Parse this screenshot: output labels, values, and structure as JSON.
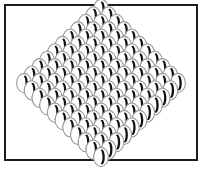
{
  "figure": {
    "canvas": {
      "width": 207,
      "height": 173,
      "background": "#ffffff"
    },
    "frame": {
      "name": "outer-border",
      "x": 5,
      "y": 5,
      "width": 192,
      "height": 155,
      "stroke": "#1c1c1c",
      "stroke_width": 2,
      "fill": "none"
    },
    "lattice": {
      "type": "rhombus",
      "arrangement": "staggered-hexagonal",
      "row_counts": [
        1,
        2,
        3,
        4,
        5,
        6,
        7,
        8,
        9,
        10,
        11,
        10,
        9,
        8,
        7,
        6,
        5,
        4,
        3,
        2,
        1
      ],
      "rows_rendered": 21,
      "total_cells": 121,
      "center_x": 101,
      "center_y": 83,
      "col_spacing": 15.4,
      "row_spacing": 7.4,
      "row_offset_alternating": true
    },
    "cell": {
      "name": "crescent-ellipse",
      "ellipse": {
        "rx": 7.4,
        "ry": 9.6,
        "fill": "#ffffff",
        "stroke": "#9a9a9a",
        "stroke_width": 1.1
      },
      "crescent": {
        "shape": "lune",
        "fill": "#111111",
        "outer_rx": 2.9,
        "outer_ry": 7.6,
        "inner_rx": 2.5,
        "inner_ry": 7.2,
        "inner_offset_x": -1.9,
        "center_offset_x": 0.9,
        "orientation": "opening-left",
        "rotation_deg": 0
      }
    },
    "colors": {
      "background": "#ffffff",
      "border": "#1c1c1c",
      "ellipse_outline": "#9a9a9a",
      "crescent": "#111111"
    }
  }
}
